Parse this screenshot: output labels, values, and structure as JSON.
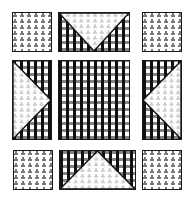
{
  "figure": {
    "fabrics": {
      "dotted": {
        "name": "white with gray dot clusters",
        "color": "#ffffff",
        "dot_color": "#777777"
      },
      "gingham": {
        "name": "black and white gingham check",
        "dark": "#111111",
        "mid": "#5a5a5a",
        "light": "#ffffff"
      }
    },
    "border_color": "#1a1a1a",
    "patches": [
      {
        "id": "top-left",
        "type": "square",
        "fabric": "dotted"
      },
      {
        "id": "top-center",
        "type": "flying-geese",
        "base": "gingham",
        "triangle": "dotted",
        "apex": "down"
      },
      {
        "id": "top-right",
        "type": "square",
        "fabric": "dotted"
      },
      {
        "id": "middle-left",
        "type": "flying-geese",
        "base": "gingham",
        "triangle": "dotted",
        "apex": "right"
      },
      {
        "id": "center",
        "type": "square",
        "fabric": "gingham"
      },
      {
        "id": "middle-right",
        "type": "flying-geese",
        "base": "gingham",
        "triangle": "dotted",
        "apex": "left"
      },
      {
        "id": "bottom-left",
        "type": "square",
        "fabric": "dotted"
      },
      {
        "id": "bottom-center",
        "type": "flying-geese",
        "base": "gingham",
        "triangle": "dotted",
        "apex": "up"
      },
      {
        "id": "bottom-right",
        "type": "square",
        "fabric": "dotted"
      }
    ]
  }
}
